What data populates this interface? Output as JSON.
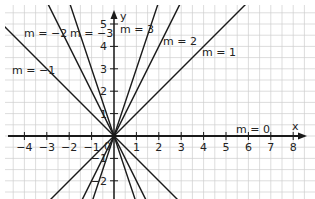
{
  "chart_data": {
    "type": "line",
    "title": "",
    "xlabel": "x",
    "ylabel": "y",
    "xlim": [
      -5,
      8.6
    ],
    "ylim": [
      -2.8,
      5.7
    ],
    "grid": true,
    "x_ticks": [
      -4,
      -3,
      -2,
      -1,
      0,
      1,
      2,
      3,
      4,
      5,
      6,
      7,
      8
    ],
    "x_tick_labels": [
      "-4",
      "-3",
      "-2",
      "-1",
      "0",
      "1",
      "2",
      "3",
      "4",
      "5",
      "6",
      "7",
      "8"
    ],
    "y_ticks": [
      -2,
      -1,
      1,
      2,
      3,
      4,
      5
    ],
    "y_tick_labels": [
      "-2",
      "-1",
      "1",
      "2",
      "3",
      "4",
      "5"
    ],
    "series": [
      {
        "name": "m = -3",
        "slope": -3,
        "intercept": 0
      },
      {
        "name": "m = -2",
        "slope": -2,
        "intercept": 0
      },
      {
        "name": "m = -1",
        "slope": -1,
        "intercept": 0
      },
      {
        "name": "m = 0",
        "slope": 0,
        "intercept": 0
      },
      {
        "name": "m = 1",
        "slope": 1,
        "intercept": 0
      },
      {
        "name": "m = 2",
        "slope": 2,
        "intercept": 0
      },
      {
        "name": "m = 3",
        "slope": 3,
        "intercept": 0
      }
    ]
  },
  "labels": {
    "m_neg3": "m = −3",
    "m_neg2": "m = −2",
    "m_neg1": "m = −1",
    "m_0": "m = 0",
    "m_1": "m = 1",
    "m_2": "m = 2",
    "m_3": "m = 3",
    "x_axis": "x",
    "y_axis": "y",
    "origin": "0"
  },
  "colors": {
    "grid": "#cfcfcf",
    "axis": "#1a1a1a",
    "line": "#1a1a1a"
  }
}
